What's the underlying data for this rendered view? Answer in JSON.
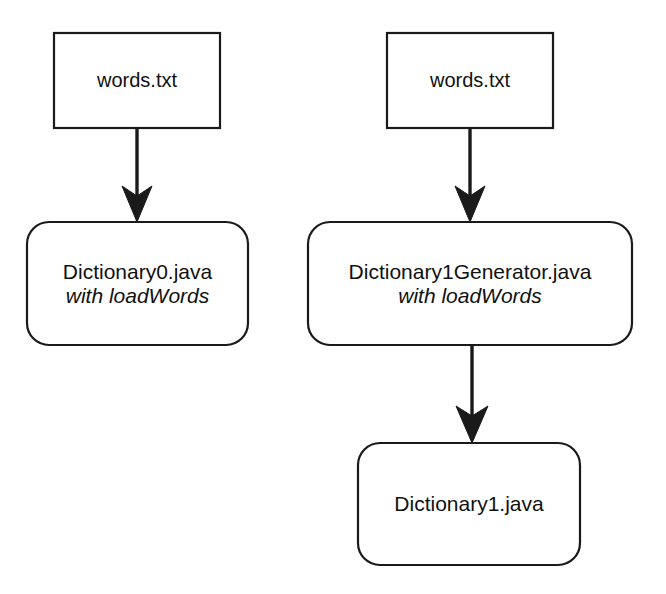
{
  "diagram": {
    "type": "flowchart",
    "background_color": "#ffffff",
    "stroke_color": "#1a1a1a",
    "fill_color": "#ffffff",
    "text_color": "#111111",
    "nodes": [
      {
        "id": "words-txt-left",
        "shape": "rectangle",
        "label": "words.txt",
        "sublabel": "",
        "x": 54,
        "y": 33,
        "width": 166,
        "height": 95
      },
      {
        "id": "dictionary0",
        "shape": "rounded-rectangle",
        "label": "Dictionary0.java",
        "sublabel": "with loadWords",
        "x": 27,
        "y": 222,
        "width": 221,
        "height": 123
      },
      {
        "id": "words-txt-right",
        "shape": "rectangle",
        "label": "words.txt",
        "sublabel": "",
        "x": 387,
        "y": 33,
        "width": 166,
        "height": 95
      },
      {
        "id": "dictionary1generator",
        "shape": "rounded-rectangle",
        "label": "Dictionary1Generator.java",
        "sublabel": "with loadWords",
        "x": 308,
        "y": 222,
        "width": 324,
        "height": 123
      },
      {
        "id": "dictionary1",
        "shape": "rounded-rectangle",
        "label": "Dictionary1.java",
        "sublabel": "",
        "x": 358,
        "y": 443,
        "width": 222,
        "height": 122
      }
    ],
    "edges": [
      {
        "id": "edge-words-to-dictionary0",
        "from": "words-txt-left",
        "to": "dictionary0",
        "x": 137,
        "y1": 128,
        "y2": 222,
        "arrowhead": "barbed",
        "label": ""
      },
      {
        "id": "edge-words-to-dictionary1gen",
        "from": "words-txt-right",
        "to": "dictionary1generator",
        "x": 470,
        "y1": 128,
        "y2": 222,
        "arrowhead": "barbed",
        "label": ""
      },
      {
        "id": "edge-dictionary1gen-to-dictionary1",
        "from": "dictionary1generator",
        "to": "dictionary1",
        "x": 472,
        "y1": 345,
        "y2": 443,
        "arrowhead": "barbed",
        "label": ""
      }
    ]
  }
}
